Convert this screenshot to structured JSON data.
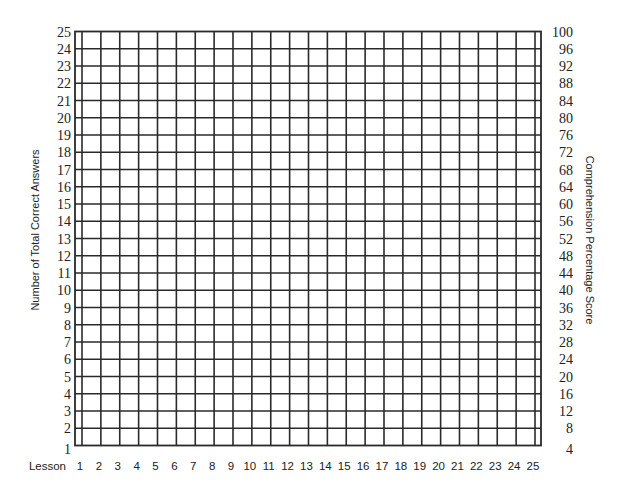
{
  "chart_data": {
    "type": "table",
    "title": "",
    "xlabel": "Lesson",
    "ylabel": "Number of Total Correct Answers",
    "y2label": "Comprehension Percentage Score",
    "categories": [
      1,
      2,
      3,
      4,
      5,
      6,
      7,
      8,
      9,
      10,
      11,
      12,
      13,
      14,
      15,
      16,
      17,
      18,
      19,
      20,
      21,
      22,
      23,
      24,
      25
    ],
    "x_ticks": [
      "1",
      "2",
      "3",
      "4",
      "5",
      "6",
      "7",
      "8",
      "9",
      "10",
      "11",
      "12",
      "13",
      "14",
      "15",
      "16",
      "17",
      "18",
      "19",
      "20",
      "21",
      "22",
      "23",
      "24",
      "25"
    ],
    "y_ticks": [
      "25",
      "24",
      "23",
      "22",
      "21",
      "20",
      "19",
      "18",
      "17",
      "16",
      "15",
      "14",
      "13",
      "12",
      "11",
      "10",
      "9",
      "8",
      "7",
      "6",
      "5",
      "4",
      "3",
      "2",
      "1"
    ],
    "y2_ticks": [
      "100",
      "96",
      "92",
      "88",
      "84",
      "80",
      "76",
      "72",
      "68",
      "64",
      "60",
      "56",
      "52",
      "48",
      "44",
      "40",
      "36",
      "32",
      "28",
      "24",
      "20",
      "16",
      "12",
      "8",
      "4"
    ],
    "ylim": [
      1,
      25
    ],
    "y2lim": [
      4,
      100
    ],
    "series": [],
    "grid": true,
    "legend": null
  },
  "colors": {
    "grid_line": "#2a2a2a",
    "text": "#222222",
    "background": "#ffffff"
  }
}
